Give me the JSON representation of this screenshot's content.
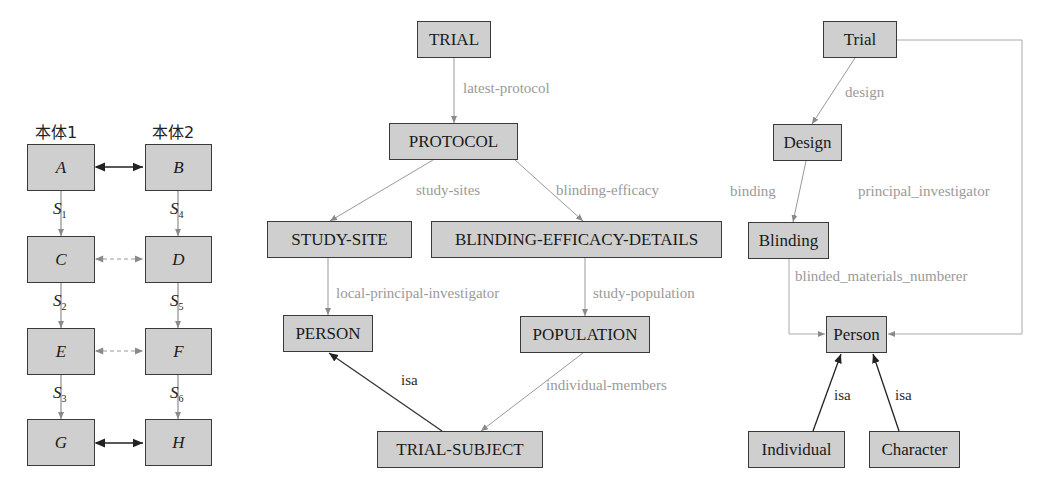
{
  "left_diagram": {
    "headers": [
      "本体1",
      "本体2"
    ],
    "nodes": {
      "A": "A",
      "B": "B",
      "C": "C",
      "D": "D",
      "E": "E",
      "F": "F",
      "G": "G",
      "H": "H"
    },
    "edges_left": [
      {
        "label": "S",
        "sub": "1"
      },
      {
        "label": "S",
        "sub": "2"
      },
      {
        "label": "S",
        "sub": "3"
      }
    ],
    "edges_right": [
      {
        "label": "S",
        "sub": "4"
      },
      {
        "label": "S",
        "sub": "5"
      },
      {
        "label": "S",
        "sub": "6"
      }
    ],
    "mappings": [
      {
        "from": "A",
        "to": "B",
        "style": "solid"
      },
      {
        "from": "C",
        "to": "D",
        "style": "dashed"
      },
      {
        "from": "E",
        "to": "F",
        "style": "dashed"
      },
      {
        "from": "G",
        "to": "H",
        "style": "solid"
      }
    ]
  },
  "middle_diagram": {
    "nodes": {
      "trial": "TRIAL",
      "protocol": "PROTOCOL",
      "study_site": "STUDY-SITE",
      "blinding": "BLINDING-EFFICACY-DETAILS",
      "person": "PERSON",
      "population": "POPULATION",
      "trial_subject": "TRIAL-SUBJECT"
    },
    "edges": {
      "latest_protocol": "latest-protocol",
      "study_sites": "study-sites",
      "blinding_efficacy": "blinding-efficacy",
      "local_pi": "local-principal-investigator",
      "study_population": "study-population",
      "individual_members": "individual-members",
      "isa": "isa"
    }
  },
  "right_diagram": {
    "nodes": {
      "trial": "Trial",
      "design": "Design",
      "blinding": "Blinding",
      "person": "Person",
      "individual": "Individual",
      "character": "Character"
    },
    "edges": {
      "design": "design",
      "binding": "binding",
      "principal_investigator": "principal_investigator",
      "blinded_materials_numberer": "blinded_materials_numberer",
      "isa_individual": "isa",
      "isa_character": "isa"
    }
  },
  "colors": {
    "box_fill": "#cfcfcf",
    "box_border": "#3a3a3a",
    "edge_gray": "#9a9a9a",
    "edge_dark": "#2a2a2a"
  }
}
